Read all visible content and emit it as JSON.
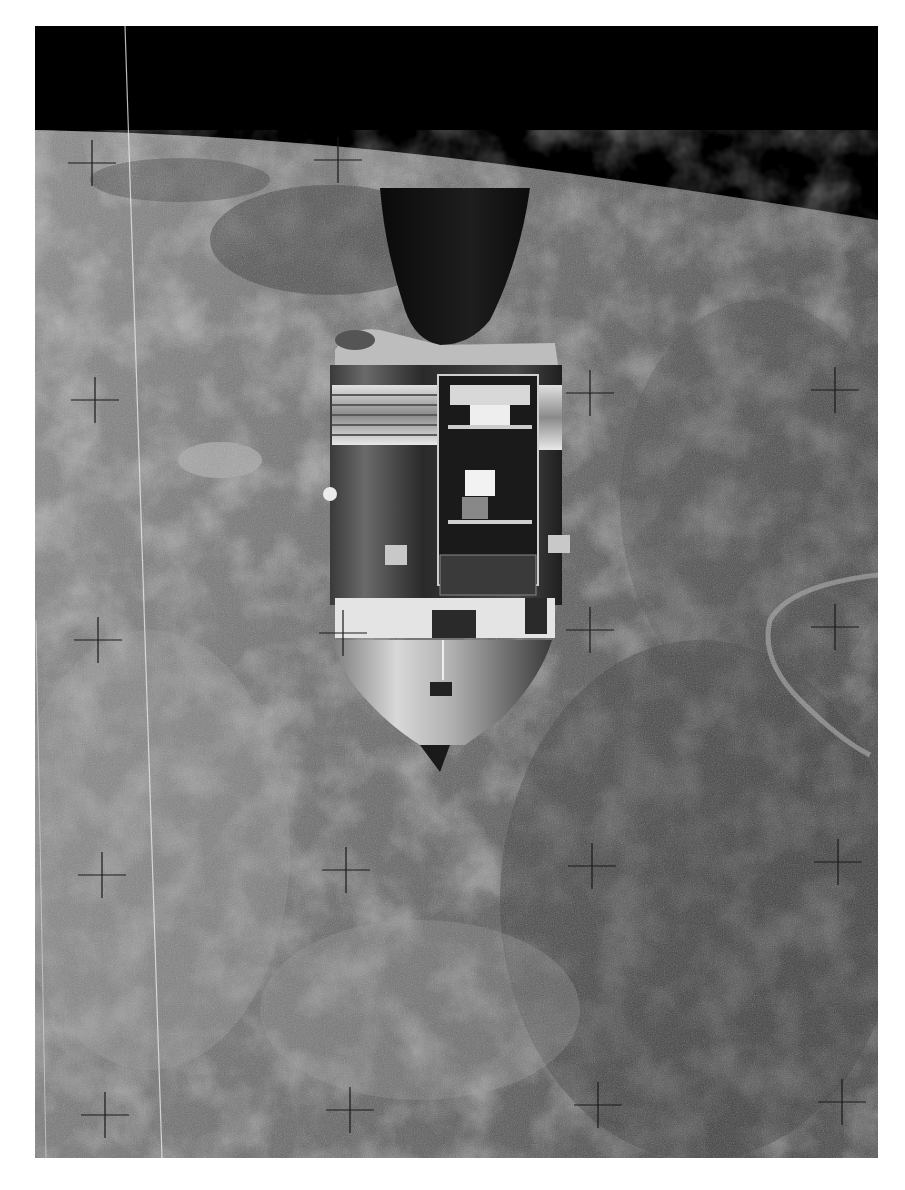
{
  "image": {
    "subject": "Apollo Command/Service Module in lunar orbit with open SIM bay",
    "style": "black-and-white photograph",
    "border_color": "#ffffff",
    "space_color": "#000000",
    "surface_color": "#6e6e6e",
    "reseau_cross_color": "#1a1a1a"
  },
  "reseau_crosses": [
    {
      "x": 92,
      "y": 163
    },
    {
      "x": 338,
      "y": 160
    },
    {
      "x": 95,
      "y": 400
    },
    {
      "x": 590,
      "y": 393
    },
    {
      "x": 835,
      "y": 390
    },
    {
      "x": 98,
      "y": 640
    },
    {
      "x": 343,
      "y": 633
    },
    {
      "x": 590,
      "y": 630
    },
    {
      "x": 835,
      "y": 627
    },
    {
      "x": 102,
      "y": 875
    },
    {
      "x": 346,
      "y": 870
    },
    {
      "x": 592,
      "y": 866
    },
    {
      "x": 838,
      "y": 862
    },
    {
      "x": 105,
      "y": 1115
    },
    {
      "x": 350,
      "y": 1110
    },
    {
      "x": 598,
      "y": 1105
    },
    {
      "x": 842,
      "y": 1102
    }
  ]
}
